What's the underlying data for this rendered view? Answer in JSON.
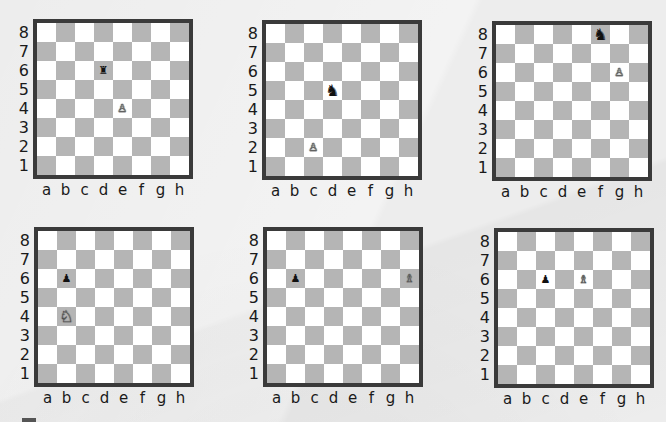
{
  "colors": {
    "background": "#ededed",
    "light_square": "#ffffff",
    "dark_square": "#b5b5b5",
    "border": "#3a3a3a"
  },
  "ranks": [
    "8",
    "7",
    "6",
    "5",
    "4",
    "3",
    "2",
    "1"
  ],
  "files": [
    "a",
    "b",
    "c",
    "d",
    "e",
    "f",
    "g",
    "h"
  ],
  "diagrams": [
    {
      "id": 1,
      "left": 11,
      "top": 19,
      "pieces": [
        {
          "square": "d6",
          "color": "black",
          "type": "rook",
          "glyph": "♜",
          "small": true
        },
        {
          "square": "e4",
          "color": "white",
          "type": "pawn",
          "glyph": "♙",
          "small": true
        }
      ]
    },
    {
      "id": 2,
      "left": 240,
      "top": 20,
      "pieces": [
        {
          "square": "d5",
          "color": "black",
          "type": "knight",
          "glyph": "♞",
          "small": false
        },
        {
          "square": "c2",
          "color": "white",
          "type": "pawn",
          "glyph": "♙",
          "small": true
        }
      ]
    },
    {
      "id": 3,
      "left": 470,
      "top": 21,
      "pieces": [
        {
          "square": "f8",
          "color": "black",
          "type": "knight",
          "glyph": "♞",
          "small": false
        },
        {
          "square": "g6",
          "color": "white",
          "type": "pawn",
          "glyph": "♙",
          "small": true
        }
      ]
    },
    {
      "id": 4,
      "left": 12,
      "top": 227,
      "pieces": [
        {
          "square": "b6",
          "color": "black",
          "type": "pawn",
          "glyph": "♟",
          "small": true
        },
        {
          "square": "b4",
          "color": "white",
          "type": "knight",
          "glyph": "♘",
          "small": false
        }
      ]
    },
    {
      "id": 5,
      "left": 241,
      "top": 227,
      "pieces": [
        {
          "square": "b6",
          "color": "black",
          "type": "pawn",
          "glyph": "♟",
          "small": true
        },
        {
          "square": "h6",
          "color": "white",
          "type": "bishop",
          "glyph": "♗",
          "small": true
        }
      ]
    },
    {
      "id": 6,
      "left": 472,
      "top": 228,
      "pieces": [
        {
          "square": "c6",
          "color": "black",
          "type": "pawn",
          "glyph": "♟",
          "small": true
        },
        {
          "square": "e6",
          "color": "white",
          "type": "bishop",
          "glyph": "♗",
          "small": true
        }
      ]
    }
  ]
}
